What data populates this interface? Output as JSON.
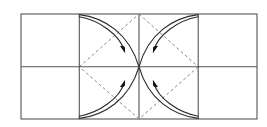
{
  "figure": {
    "kind": "folding-diagram",
    "canvas": {
      "width": 267,
      "height": 127,
      "background": "#ffffff"
    },
    "colors": {
      "outline": "#555555",
      "grid": "#555555",
      "crease_dashed": "#8a8a8a",
      "arc": "#2b2b2b",
      "arrowhead": "#111111",
      "background": "#ffffff"
    },
    "strokes": {
      "outline_width": 1.1,
      "grid_width": 1.1,
      "crease_width": 1.0,
      "crease_dash": "3,2.6",
      "arc_width": 1.15
    },
    "frame": {
      "label": "outer-rectangle",
      "x": 21,
      "y": 14,
      "width": 236,
      "height": 105,
      "columns": 4,
      "rows": 2
    },
    "grid_lines": {
      "vertical_x": [
        79.3,
        139,
        198.2
      ],
      "horizontal_y": [
        66.8
      ]
    },
    "center_panel": {
      "label": "central-square-region",
      "left": 79.3,
      "right": 198.2,
      "top": 14,
      "bottom": 119,
      "center_x": 139,
      "center_y": 66.8
    },
    "crease_diamond": {
      "label": "dashed-diamond-creases",
      "points": [
        {
          "name": "top-midpoint",
          "x": 139,
          "y": 14
        },
        {
          "name": "right-midpoint",
          "x": 198.2,
          "y": 66.8
        },
        {
          "name": "bottom-midpoint",
          "x": 139,
          "y": 119
        },
        {
          "name": "left-midpoint",
          "x": 79.3,
          "y": 66.8
        }
      ]
    },
    "fold_arrows": [
      {
        "name": "top-left-fold-arrow",
        "quadrant": "top-left",
        "origin": {
          "x": 79.3,
          "y": 14
        },
        "tip": {
          "x": 124.5,
          "y": 51.5
        },
        "direction": "down-right",
        "arrowhead_angle_deg": 47
      },
      {
        "name": "top-right-fold-arrow",
        "quadrant": "top-right",
        "origin": {
          "x": 198.2,
          "y": 14
        },
        "tip": {
          "x": 153.5,
          "y": 51.5
        },
        "direction": "down-left",
        "arrowhead_angle_deg": 133
      },
      {
        "name": "bottom-left-fold-arrow",
        "quadrant": "bottom-left",
        "origin": {
          "x": 79.3,
          "y": 119
        },
        "tip": {
          "x": 124.5,
          "y": 81.5
        },
        "direction": "up-right",
        "arrowhead_angle_deg": -47
      },
      {
        "name": "bottom-right-fold-arrow",
        "quadrant": "bottom-right",
        "origin": {
          "x": 198.2,
          "y": 119
        },
        "tip": {
          "x": 153.5,
          "y": 81.5
        },
        "direction": "up-left",
        "arrowhead_angle_deg": -133
      }
    ],
    "arc_pairs": [
      {
        "name": "top-left-arc-pair",
        "outer_path": "M 79.3 14.6 C 104 17.6 129 33 139 66.8",
        "inner_path": "M 79.3 16.6 C 100 20.5 119.5 35 124.5 51.5"
      },
      {
        "name": "top-right-arc-pair",
        "outer_path": "M 198.2 14.6 C 173.5 17.6 148.5 33 139 66.8",
        "inner_path": "M 198.2 16.6 C 177.5 20.5 158 35 153.5 51.5"
      },
      {
        "name": "bottom-left-arc-pair",
        "outer_path": "M 79.3 118.4 C 104 115.4 129 100 139 66.8",
        "inner_path": "M 79.3 116.4 C 100 112.5 119.5 98 124.5 81.5"
      },
      {
        "name": "bottom-right-arc-pair",
        "outer_path": "M 198.2 118.4 C 173.5 115.4 148.5 100 139 66.8",
        "inner_path": "M 198.2 116.4 C 177.5 112.5 158 98 153.5 81.5"
      }
    ]
  }
}
